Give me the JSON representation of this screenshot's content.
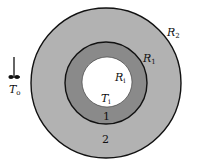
{
  "diagram": {
    "type": "concentric-cylinder-cross-section",
    "regions": [
      {
        "id": "1",
        "label": "1",
        "description": "inner layer",
        "color": "#8a8a8a"
      },
      {
        "id": "2",
        "label": "2",
        "description": "outer layer",
        "color": "#b2b2b2"
      }
    ],
    "hole_color": "#ffffff",
    "outline_color": "#111111",
    "labels": {
      "R2": {
        "main": "R",
        "sub": "2"
      },
      "R1": {
        "main": "R",
        "sub": "1"
      },
      "Ri": {
        "main": "R",
        "sub": "i"
      },
      "Ti": {
        "main": "T",
        "sub": "i"
      },
      "To": {
        "main": "T",
        "sub": "o"
      },
      "region1": "1",
      "region2": "2"
    },
    "ambient_symbol": "thermometer-icon"
  }
}
